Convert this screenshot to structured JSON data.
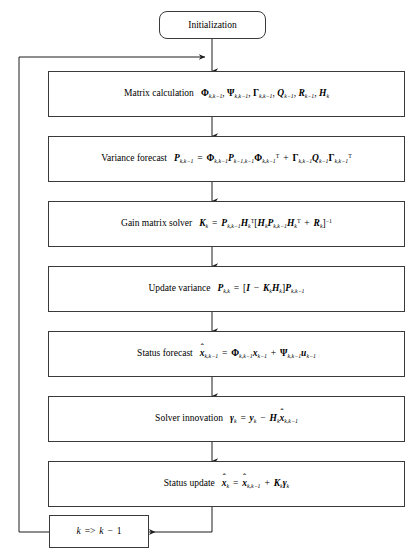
{
  "diagram": {
    "type": "flowchart",
    "orientation": "top-to-bottom-with-feedback-loop",
    "stroke_color": "#3a3a3a",
    "text_color": "#000000",
    "background_color": "#ffffff"
  },
  "nodes": [
    {
      "id": "initialization",
      "shape": "rounded-rectangle",
      "label": "Initialization",
      "equation_plain": ""
    },
    {
      "id": "matrix-calculation",
      "shape": "rectangle",
      "label": "Matrix calculation",
      "equation_plain": "Φ k,k−1 , Ψ k,k−1 , Γ k,k−1 , Q k−1 , R k−1 , H k"
    },
    {
      "id": "variance-forecast",
      "shape": "rectangle",
      "label": "Variance forecast",
      "equation_plain": "P k,k−1 = Φ k,k−1 P k−1,k−1 Φ k,k−1 T + Γ k,k−1 Q k−1 Γ k,k−1 T"
    },
    {
      "id": "gain-matrix-solver",
      "shape": "rectangle",
      "label": "Gain matrix solver",
      "equation_plain": "K k = P k,k−1 H k T [ H k P k,k−1 H k T + R k ]⁻¹"
    },
    {
      "id": "update-variance",
      "shape": "rectangle",
      "label": "Update variance",
      "equation_plain": "P k,k = [ I − K k H k ] P k,k−1"
    },
    {
      "id": "status-forecast",
      "shape": "rectangle",
      "label": "Status forecast",
      "equation_plain": "x̂ k,k−1 = Φ k,k−1 x k−1 + Ψ k,k−1 u k−1"
    },
    {
      "id": "solver-innovation",
      "shape": "rectangle",
      "label": "Solver innovation",
      "equation_plain": "γ k = y k − H k x̂ k,k−1"
    },
    {
      "id": "status-update",
      "shape": "rectangle",
      "label": "Status update",
      "equation_plain": "x̂ k = x̂ k,k−1 + K k γ k"
    },
    {
      "id": "loop-counter",
      "shape": "rectangle",
      "label": "",
      "equation_plain": "k => k − 1"
    }
  ],
  "edges": [
    {
      "id": "edge-init-to-matrix",
      "from": "initialization",
      "to": "matrix-calculation",
      "arrow": "down"
    },
    {
      "id": "edge-matrix-to-variance",
      "from": "matrix-calculation",
      "to": "variance-forecast",
      "arrow": "down"
    },
    {
      "id": "edge-variance-to-gain",
      "from": "variance-forecast",
      "to": "gain-matrix-solver",
      "arrow": "down"
    },
    {
      "id": "edge-gain-to-update-variance",
      "from": "gain-matrix-solver",
      "to": "update-variance",
      "arrow": "down"
    },
    {
      "id": "edge-update-variance-to-status-forecast",
      "from": "update-variance",
      "to": "status-forecast",
      "arrow": "down"
    },
    {
      "id": "edge-status-forecast-to-innovation",
      "from": "status-forecast",
      "to": "solver-innovation",
      "arrow": "down"
    },
    {
      "id": "edge-innovation-to-status-update",
      "from": "solver-innovation",
      "to": "status-update",
      "arrow": "down"
    },
    {
      "id": "edge-status-update-to-loop-counter",
      "from": "status-update",
      "to": "loop-counter",
      "arrow": "left"
    },
    {
      "id": "edge-loop-counter-feedback",
      "from": "loop-counter",
      "to": "matrix-calculation",
      "arrow": "right"
    }
  ]
}
